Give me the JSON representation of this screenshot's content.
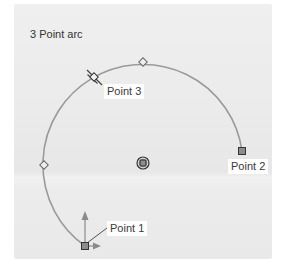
{
  "title": "3 Point arc",
  "points": {
    "p1": {
      "label": "Point 1",
      "x": 85,
      "y": 246
    },
    "p2": {
      "label": "Point 2",
      "x": 242,
      "y": 151
    },
    "p3": {
      "label": "Point 3",
      "x": 94,
      "y": 77
    }
  },
  "center": {
    "x": 143,
    "y": 163
  },
  "midpoints": [
    {
      "x": 143,
      "y": 62
    },
    {
      "x": 44,
      "y": 165
    }
  ],
  "radius": 100,
  "colors": {
    "arc": "#9a9a9a",
    "marker_fill": "#8c8c8c",
    "marker_stroke": "#333333",
    "arrow": "#8a8a8a",
    "background": "#ebebeb"
  }
}
